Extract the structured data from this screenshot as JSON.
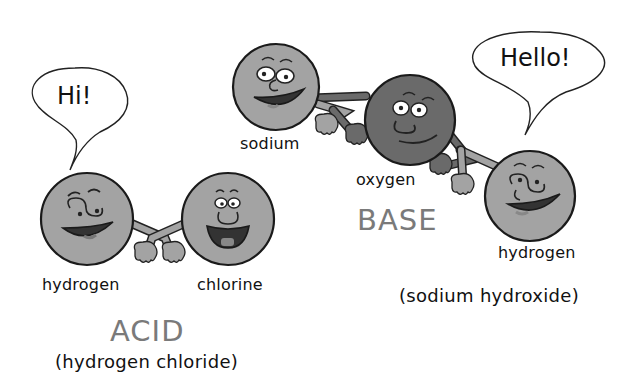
{
  "colors": {
    "atom_light": "#a3a3a3",
    "atom_dark": "#6a6a6a",
    "outline": "#1a1a1a",
    "heading_gray": "#7a7a7a",
    "text": "#111111",
    "background": "#ffffff"
  },
  "acid": {
    "speech": "Hi!",
    "atoms": [
      {
        "name": "hydrogen",
        "label": "hydrogen",
        "expression": "winking-smile"
      },
      {
        "name": "chlorine",
        "label": "chlorine",
        "expression": "big-open-smile"
      }
    ],
    "heading": "ACID",
    "compound": "(hydrogen chloride)"
  },
  "base": {
    "speech": "Hello!",
    "atoms": [
      {
        "name": "sodium",
        "label": "sodium",
        "expression": "grin"
      },
      {
        "name": "oxygen",
        "label": "oxygen",
        "expression": "smirk"
      },
      {
        "name": "hydrogen",
        "label": "hydrogen",
        "expression": "winking-smile"
      }
    ],
    "heading": "BASE",
    "compound": "(sodium hydroxide)"
  }
}
